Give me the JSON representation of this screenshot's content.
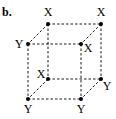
{
  "panel_label": "b.",
  "diagram": {
    "type": "cube-lattice",
    "vertices": [
      {
        "id": "back-top-left",
        "x": 48,
        "y": 24,
        "label": "X",
        "lx": 48,
        "ly": 16
      },
      {
        "id": "back-top-right",
        "x": 101,
        "y": 24,
        "label": "X",
        "lx": 101,
        "ly": 16
      },
      {
        "id": "front-top-left",
        "x": 28,
        "y": 44,
        "label": "Y",
        "lx": 19,
        "ly": 48
      },
      {
        "id": "front-top-right",
        "x": 81,
        "y": 44,
        "label": "X",
        "lx": 88,
        "ly": 52
      },
      {
        "id": "back-bottom-left",
        "x": 48,
        "y": 79,
        "label": "X",
        "lx": 41,
        "ly": 78
      },
      {
        "id": "back-bottom-right",
        "x": 101,
        "y": 79,
        "label": "Y",
        "lx": 107,
        "ly": 90
      },
      {
        "id": "front-bottom-left",
        "x": 28,
        "y": 99,
        "label": "Y",
        "lx": 28,
        "ly": 113
      },
      {
        "id": "front-bottom-right",
        "x": 81,
        "y": 99,
        "label": "Y",
        "lx": 81,
        "ly": 113
      }
    ],
    "edges": [
      [
        "back-top-left",
        "back-top-right"
      ],
      [
        "front-top-left",
        "front-top-right"
      ],
      [
        "back-bottom-left",
        "back-bottom-right"
      ],
      [
        "front-bottom-left",
        "front-bottom-right"
      ],
      [
        "back-top-left",
        "back-bottom-left"
      ],
      [
        "back-top-right",
        "back-bottom-right"
      ],
      [
        "front-top-left",
        "front-bottom-left"
      ],
      [
        "front-top-right",
        "front-bottom-right"
      ],
      [
        "back-top-left",
        "front-top-left"
      ],
      [
        "back-top-right",
        "front-top-right"
      ],
      [
        "back-bottom-left",
        "front-bottom-left"
      ],
      [
        "back-bottom-right",
        "front-bottom-right"
      ]
    ],
    "edge_style": "dashed",
    "color": "#000000"
  }
}
